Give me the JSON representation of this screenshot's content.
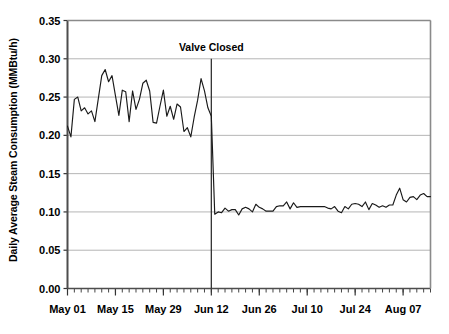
{
  "chart_data": {
    "type": "line",
    "title": "",
    "xlabel": "",
    "ylabel": "Daily Average Steam Consumption (MMBtu/h)",
    "ylim": [
      0.0,
      0.35
    ],
    "ytick_labels": [
      "0.00",
      "0.05",
      "0.10",
      "0.15",
      "0.20",
      "0.25",
      "0.30",
      "0.35"
    ],
    "ytick_values": [
      0.0,
      0.05,
      0.1,
      0.15,
      0.2,
      0.25,
      0.3,
      0.35
    ],
    "xtick_labels": [
      "May 01",
      "May 15",
      "May 29",
      "Jun 12",
      "Jun 26",
      "Jul 10",
      "Jul 24",
      "Aug 07"
    ],
    "xtick_indices": [
      0,
      14,
      28,
      42,
      56,
      70,
      84,
      98
    ],
    "x_minor_tick_interval_days": 2,
    "grid": "horizontal",
    "legend": "none",
    "line_color": "#1a1a1a",
    "gridline_color": "#b5b5b5",
    "axis_color": "#555555",
    "annotations": [
      {
        "label": "Valve Closed",
        "x_index": 42,
        "line_from_value": 0.3,
        "line_to_value": 0.0
      }
    ],
    "series": [
      {
        "name": "Daily Average Steam Consumption",
        "values": [
          0.212,
          0.198,
          0.247,
          0.25,
          0.232,
          0.236,
          0.228,
          0.232,
          0.218,
          0.248,
          0.278,
          0.286,
          0.27,
          0.278,
          0.252,
          0.226,
          0.259,
          0.257,
          0.218,
          0.258,
          0.234,
          0.247,
          0.268,
          0.272,
          0.258,
          0.217,
          0.216,
          0.238,
          0.259,
          0.225,
          0.238,
          0.221,
          0.241,
          0.237,
          0.205,
          0.21,
          0.198,
          0.224,
          0.246,
          0.274,
          0.258,
          0.236,
          0.225,
          0.097,
          0.1,
          0.099,
          0.105,
          0.101,
          0.103,
          0.103,
          0.096,
          0.104,
          0.106,
          0.104,
          0.1,
          0.11,
          0.106,
          0.104,
          0.101,
          0.101,
          0.101,
          0.107,
          0.108,
          0.108,
          0.113,
          0.104,
          0.112,
          0.106,
          0.107,
          0.107,
          0.107,
          0.107,
          0.107,
          0.107,
          0.107,
          0.107,
          0.105,
          0.104,
          0.107,
          0.101,
          0.099,
          0.107,
          0.104,
          0.11,
          0.111,
          0.11,
          0.107,
          0.113,
          0.103,
          0.111,
          0.109,
          0.106,
          0.108,
          0.106,
          0.109,
          0.109,
          0.122,
          0.131,
          0.116,
          0.113,
          0.119,
          0.12,
          0.116,
          0.122,
          0.124,
          0.12,
          0.12
        ]
      }
    ]
  }
}
